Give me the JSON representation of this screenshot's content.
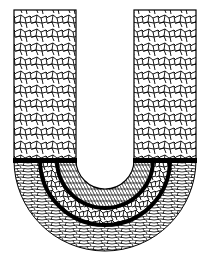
{
  "diagram": {
    "regions": [
      {
        "id": "left-arm",
        "texture": "equiaxed-coarse-grains"
      },
      {
        "id": "right-arm",
        "texture": "equiaxed-coarse-grains"
      },
      {
        "id": "bend-inner-zone",
        "texture": "fine-radial-grains"
      },
      {
        "id": "bend-middle-zone",
        "texture": "equiaxed-grains"
      },
      {
        "id": "bend-outer-zone",
        "texture": "elongated-curved-grains"
      }
    ],
    "boundaries": [
      "horizontal-bar",
      "inner-arc",
      "outer-arc"
    ],
    "colors": {
      "ink": "#000000",
      "background": "#ffffff"
    }
  }
}
